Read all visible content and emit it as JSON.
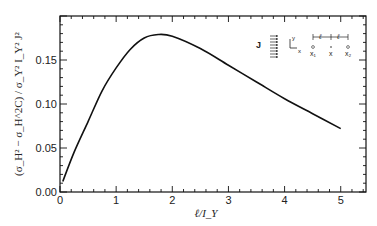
{
  "chart_data": {
    "type": "line",
    "title": "",
    "xlabel": "ℓ/I_Y",
    "ylabel": "(σ_H² − σ_H^2C) / σ_Y² I_Y² J²",
    "xlim": [
      0,
      5.45
    ],
    "ylim": [
      0,
      0.2
    ],
    "x_ticks": [
      0,
      1,
      2,
      3,
      4,
      5
    ],
    "x_tick_labels": [
      "0",
      "1",
      "2",
      "3",
      "4",
      "5"
    ],
    "y_ticks": [
      0.0,
      0.05,
      0.1,
      0.15
    ],
    "y_tick_labels": [
      "0.00",
      "0.05",
      "0.10",
      "0.15"
    ],
    "grid": false,
    "series": [
      {
        "name": "variance difference",
        "x": [
          0.05,
          0.25,
          0.5,
          0.75,
          1.0,
          1.25,
          1.5,
          1.75,
          2.0,
          2.5,
          3.0,
          3.5,
          4.0,
          4.5,
          5.0
        ],
        "values": [
          0.012,
          0.045,
          0.08,
          0.115,
          0.141,
          0.162,
          0.175,
          0.179,
          0.177,
          0.163,
          0.144,
          0.125,
          0.106,
          0.089,
          0.072
        ]
      }
    ],
    "annotations": {
      "flux_label": "J",
      "axes_inset": {
        "x": "x",
        "y": "y"
      },
      "points": [
        "x₁",
        "x",
        "x₂"
      ],
      "spacing": [
        "ℓ",
        "ℓ"
      ]
    }
  }
}
